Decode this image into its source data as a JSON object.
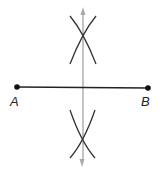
{
  "diagram": {
    "points": [
      {
        "id": "A",
        "label": "A",
        "x": 17,
        "y": 87
      },
      {
        "id": "B",
        "label": "B",
        "x": 148,
        "y": 88
      }
    ],
    "segment": {
      "from": "A",
      "to": "B"
    },
    "bisector": {
      "x": 83,
      "y_top": 8,
      "y_bottom": 165,
      "arrows": "both"
    },
    "arc_intersections": [
      {
        "position": "above",
        "x": 83,
        "y": 33
      },
      {
        "position": "below",
        "x": 82,
        "y": 142
      }
    ],
    "colors": {
      "segment": "#222222",
      "points": "#111111",
      "arcs": "#333333",
      "bisector": "#aaaaaa",
      "labels": "#222222"
    }
  }
}
